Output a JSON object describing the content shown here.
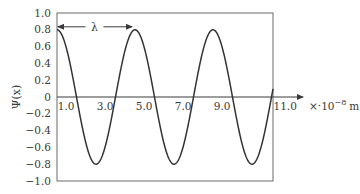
{
  "chart_data": {
    "type": "line",
    "title": "",
    "xlabel": "x · 10^-8 m",
    "ylabel": "Ψ(x)",
    "x_unit_text": "×·10",
    "x_unit_exp": "−8",
    "x_unit_suffix": "m",
    "xlim": [
      0,
      11.5
    ],
    "ylim": [
      -1.0,
      1.0
    ],
    "grid": false,
    "legend": null,
    "y_ticks": [
      "1.0",
      "0.8",
      "0.6",
      "0.4",
      "0.2",
      "0",
      "−0.2",
      "−0.4",
      "−0.6",
      "−0.8",
      "−1.0"
    ],
    "y_tick_values": [
      1.0,
      0.8,
      0.6,
      0.4,
      0.2,
      0,
      -0.2,
      -0.4,
      -0.6,
      -0.8,
      -1.0
    ],
    "x_ticks": [
      "1.0",
      "3.0",
      "5.0",
      "7.0",
      "9.0",
      "11.0"
    ],
    "x_tick_values": [
      1,
      3,
      5,
      7,
      9,
      11
    ],
    "annotation": {
      "label": "λ",
      "from_x": 0,
      "to_x": 4,
      "y": 0.8
    },
    "series": [
      {
        "name": "Ψ(x) = 0.8 cos(2πx/λ), λ = 4",
        "amplitude": 0.8,
        "wavelength": 4,
        "x": [
          0,
          1,
          2,
          3,
          4,
          5,
          6,
          7,
          8,
          9,
          10,
          11
        ],
        "values": [
          0.8,
          0,
          -0.8,
          0,
          0.8,
          0,
          -0.8,
          0,
          0.8,
          0,
          -0.8,
          0
        ]
      }
    ]
  }
}
